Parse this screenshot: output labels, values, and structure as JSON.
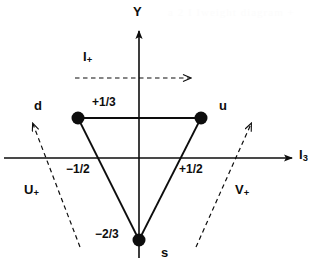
{
  "figure": {
    "type": "su3-weight-diagram",
    "title_present": false,
    "background_color": "#ffffff",
    "ink_color": "#0d0d0d"
  },
  "axes": {
    "vertical": {
      "label": "Y",
      "label_x": 133,
      "label_y": 5
    },
    "horizontal": {
      "label": "I",
      "label_sub": "3",
      "label_x": 299,
      "label_y": 148
    },
    "origin": {
      "x": 139,
      "y": 158
    }
  },
  "points": [
    {
      "id": "d",
      "label": "d",
      "label_x": 34,
      "label_y": 99,
      "x": 78,
      "y": 118,
      "i3": "-1/2",
      "y_hypercharge": "+1/3"
    },
    {
      "id": "u",
      "label": "u",
      "label_x": 219,
      "label_y": 99,
      "x": 201,
      "y": 118,
      "i3": "+1/2",
      "y_hypercharge": "+1/3"
    },
    {
      "id": "s",
      "label": "s",
      "label_x": 161,
      "label_y": 246,
      "x": 139,
      "y": 240,
      "i3": "0",
      "y_hypercharge": "-2/3"
    }
  ],
  "value_labels": [
    {
      "id": "y-plus-one-third",
      "text": "+1/3",
      "x": 92,
      "y": 96
    },
    {
      "id": "i3-minus-half",
      "text": "−1/2",
      "x": 66,
      "y": 163
    },
    {
      "id": "i3-plus-half",
      "text": "+1/2",
      "x": 179,
      "y": 163
    },
    {
      "id": "y-minus-two-thirds",
      "text": "−2/3",
      "x": 95,
      "y": 228
    }
  ],
  "operators": [
    {
      "id": "i-plus",
      "label": "I",
      "label_sub": "+",
      "label_x": 83,
      "label_y": 50,
      "arrow": {
        "x1": 75,
        "y1": 78,
        "x2": 197,
        "y2": 78,
        "style": "dashed"
      }
    },
    {
      "id": "u-plus",
      "label": "U",
      "label_sub": "+",
      "label_x": 24,
      "label_y": 183,
      "arrow": {
        "x1": 80,
        "y1": 247,
        "x2": 30,
        "y2": 118,
        "style": "dashed"
      }
    },
    {
      "id": "v-plus",
      "label": "V",
      "label_sub": "+",
      "label_x": 235,
      "label_y": 183,
      "arrow": {
        "x1": 196,
        "y1": 247,
        "x2": 254,
        "y2": 118,
        "style": "dashed"
      }
    }
  ],
  "triangle": {
    "edges": [
      {
        "from": "d",
        "to": "u"
      },
      {
        "from": "d",
        "to": "s"
      },
      {
        "from": "u",
        "to": "s"
      }
    ],
    "style": "solid"
  },
  "bleed_text": {
    "top": "a 2   I Iweight diagram   +"
  }
}
